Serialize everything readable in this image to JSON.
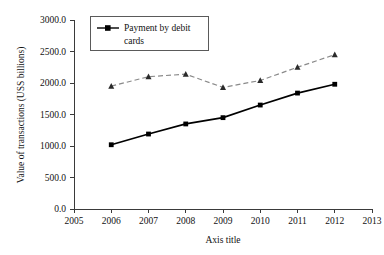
{
  "chart_data": {
    "type": "line",
    "title": "",
    "xlabel": "Axis title",
    "ylabel": "Value of transactions (USS billions)",
    "x": [
      2006,
      2007,
      2008,
      2009,
      2010,
      2011,
      2012
    ],
    "xlim": [
      2005,
      2013
    ],
    "ylim": [
      0,
      3000
    ],
    "grid": false,
    "legend_position": "top-left",
    "x_tick_labels": [
      "2005",
      "2006",
      "2007",
      "2008",
      "2009",
      "2010",
      "2011",
      "2012",
      "2013"
    ],
    "y_tick_labels": [
      "0.0",
      "500.0",
      "1000.0",
      "1500.0",
      "2000.0",
      "2500.0",
      "3000.0"
    ],
    "y_ticks": [
      0,
      500,
      1000,
      1500,
      2000,
      2500,
      3000
    ],
    "series": [
      {
        "name": "Payment by debit cards",
        "values": [
          1020,
          1190,
          1350,
          1450,
          1650,
          1840,
          1980
        ],
        "color": "#000000",
        "style": "solid",
        "marker": "square",
        "in_legend": true
      },
      {
        "name": "",
        "values": [
          1950,
          2100,
          2140,
          1930,
          2040,
          2250,
          2450
        ],
        "color": "#8a8a8a",
        "style": "dashed",
        "marker": "triangle",
        "in_legend": false
      }
    ]
  },
  "legend": {
    "entries": [
      {
        "label": "Payment by debit cards"
      }
    ]
  }
}
